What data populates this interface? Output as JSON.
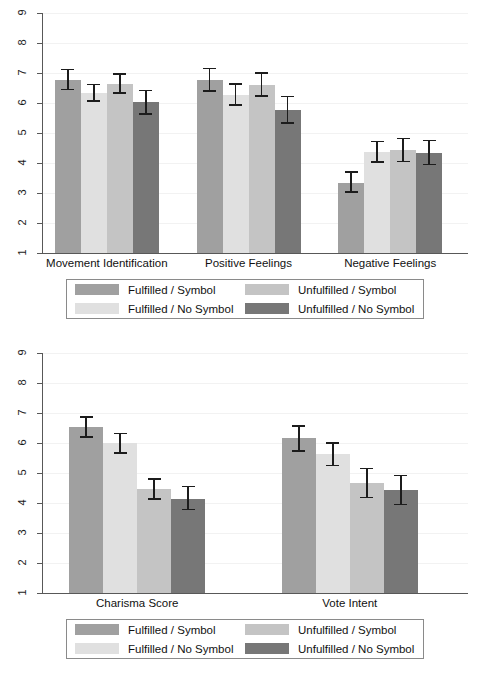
{
  "figure": {
    "background": "#ffffff",
    "palette": {
      "fulfilled_symbol": "#a0a0a0",
      "fulfilled_no_symbol": "#e0e0e0",
      "unfulfilled_symbol": "#c4c4c4",
      "unfulfilled_no_symbol": "#777777",
      "axis": "#585858",
      "grid": "#f2f2f2",
      "error_bar": "#1c1c1c",
      "text": "#111111"
    },
    "legend": {
      "items": [
        {
          "label": "Fulfilled / Symbol",
          "color": "#a0a0a0"
        },
        {
          "label": "Unfulfilled / Symbol",
          "color": "#c4c4c4"
        },
        {
          "label": "Fulfilled / No Symbol",
          "color": "#e0e0e0"
        },
        {
          "label": "Unfulfilled / No Symbol",
          "color": "#777777"
        }
      ]
    }
  },
  "chart_data": [
    {
      "type": "bar",
      "title": "",
      "xlabel": "",
      "ylabel": "",
      "ylim": [
        1,
        9
      ],
      "yticks": [
        1,
        2,
        3,
        4,
        5,
        6,
        7,
        8,
        9
      ],
      "ytick_labels": [
        "1",
        "2",
        "3",
        "4",
        "5",
        "6",
        "7",
        "8",
        "9"
      ],
      "grid": true,
      "legend_position": "below-axis",
      "categories": [
        "Movement Identification",
        "Positive Feelings",
        "Negative Feelings"
      ],
      "series": [
        {
          "name": "Fulfilled / Symbol",
          "color": "#a0a0a0",
          "values": [
            6.78,
            6.78,
            3.35
          ],
          "err_low": [
            6.42,
            6.37,
            3.0
          ],
          "err_high": [
            7.15,
            7.18,
            3.72
          ]
        },
        {
          "name": "Fulfilled / No Symbol",
          "color": "#e0e0e0",
          "values": [
            6.34,
            6.28,
            4.37
          ],
          "err_low": [
            6.05,
            5.9,
            4.0
          ],
          "err_high": [
            6.65,
            6.66,
            4.75
          ]
        },
        {
          "name": "Unfulfilled / Symbol",
          "color": "#c4c4c4",
          "values": [
            6.63,
            6.6,
            4.43
          ],
          "err_low": [
            6.3,
            6.2,
            4.02
          ],
          "err_high": [
            7.0,
            7.02,
            4.85
          ]
        },
        {
          "name": "Unfulfilled / No Symbol",
          "color": "#777777",
          "values": [
            6.03,
            5.78,
            4.35
          ],
          "err_low": [
            5.6,
            5.3,
            3.92
          ],
          "err_high": [
            6.45,
            6.24,
            4.78
          ]
        }
      ]
    },
    {
      "type": "bar",
      "title": "",
      "xlabel": "",
      "ylabel": "",
      "ylim": [
        1,
        9
      ],
      "yticks": [
        1,
        2,
        3,
        4,
        5,
        6,
        7,
        8,
        9
      ],
      "ytick_labels": [
        "1",
        "2",
        "3",
        "4",
        "5",
        "6",
        "7",
        "8",
        "9"
      ],
      "grid": true,
      "legend_position": "below-axis",
      "categories": [
        "Charisma Score",
        "Vote Intent"
      ],
      "series": [
        {
          "name": "Fulfilled / Symbol",
          "color": "#a0a0a0",
          "values": [
            6.52,
            6.17
          ],
          "err_low": [
            6.17,
            5.7
          ],
          "err_high": [
            6.9,
            6.6
          ]
        },
        {
          "name": "Fulfilled / No Symbol",
          "color": "#e0e0e0",
          "values": [
            6.0,
            5.62
          ],
          "err_low": [
            5.65,
            5.22
          ],
          "err_high": [
            6.35,
            6.03
          ]
        },
        {
          "name": "Unfulfilled / Symbol",
          "color": "#c4c4c4",
          "values": [
            4.46,
            4.66
          ],
          "err_low": [
            4.1,
            4.15
          ],
          "err_high": [
            4.83,
            5.17
          ]
        },
        {
          "name": "Unfulfilled / No Symbol",
          "color": "#777777",
          "values": [
            4.15,
            4.43
          ],
          "err_low": [
            3.75,
            3.93
          ],
          "err_high": [
            4.57,
            4.95
          ]
        }
      ]
    }
  ]
}
